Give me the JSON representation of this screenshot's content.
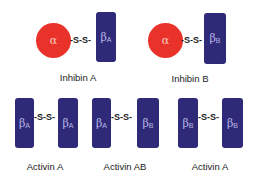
{
  "diagram": {
    "title": "",
    "complexes": [
      {
        "name": "Inhibin A",
        "left": {
          "shape": "circle",
          "symbol": "α",
          "sub": ""
        },
        "bond": "-S-S-",
        "right": {
          "shape": "rect",
          "symbol": "β",
          "sub": "A"
        }
      },
      {
        "name": "Inhibin B",
        "left": {
          "shape": "circle",
          "symbol": "α",
          "sub": ""
        },
        "bond": "-S-S-",
        "right": {
          "shape": "rect",
          "symbol": "β",
          "sub": "B"
        }
      },
      {
        "name": "Activin A",
        "left": {
          "shape": "rect",
          "symbol": "β",
          "sub": "A"
        },
        "bond": "-S-S-",
        "right": {
          "shape": "rect",
          "symbol": "β",
          "sub": "A"
        }
      },
      {
        "name": "Activin AB",
        "left": {
          "shape": "rect",
          "symbol": "β",
          "sub": "A"
        },
        "bond": "-S-S-",
        "right": {
          "shape": "rect",
          "symbol": "β",
          "sub": "B"
        }
      },
      {
        "name": "Activin A",
        "left": {
          "shape": "rect",
          "symbol": "β",
          "sub": "B"
        },
        "bond": "-S-S-",
        "right": {
          "shape": "rect",
          "symbol": "β",
          "sub": "B"
        }
      }
    ],
    "colors": {
      "alpha_subunit": "#e8322a",
      "beta_subunit": "#2e2a78",
      "text": "#222222"
    }
  }
}
